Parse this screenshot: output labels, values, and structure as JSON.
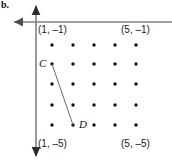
{
  "figure": {
    "part_label": "b."
  },
  "axes": {
    "x_axis": {
      "name": "x-axis",
      "orientation": "horizontal",
      "y": 22,
      "x_start": 14,
      "x_end": 172,
      "arrow": "left",
      "color": "#808080"
    },
    "y_axis": {
      "name": "y-axis",
      "orientation": "vertical",
      "x": 36,
      "y_start": 6,
      "y_end": 156,
      "arrow": "both",
      "color": "#808080"
    }
  },
  "corner_labels": {
    "top_left": "(1, –1)",
    "top_right": "(5, –1)",
    "bottom_left": "(1, –5)",
    "bottom_right": "(5, –5)"
  },
  "lattice": {
    "columns": 5,
    "rows": 5,
    "x_positions": [
      52,
      73,
      94,
      115,
      136
    ],
    "y_positions": [
      45,
      64,
      84,
      105,
      125
    ],
    "dot_radius": 1.7,
    "dot_color": "#111111",
    "x_values": [
      1,
      2,
      3,
      4,
      5
    ],
    "y_values": [
      -1,
      -2,
      -3,
      -4,
      -5
    ]
  },
  "points": [
    {
      "label": "C",
      "grid": [
        1,
        -2
      ],
      "x": 52,
      "y": 64,
      "label_side": "left"
    },
    {
      "label": "D",
      "grid": [
        2,
        -5
      ],
      "x": 73,
      "y": 125,
      "label_side": "right"
    }
  ],
  "segment": {
    "name": "segment-cd",
    "from": "C",
    "to": "D",
    "x1": 52,
    "y1": 64,
    "x2": 73,
    "y2": 125,
    "color": "#6b6b6b",
    "width": 1
  },
  "colors": {
    "axis": "#808080",
    "segment": "#6b6b6b",
    "dot": "#111111",
    "text": "#1a1a1a",
    "background": "#ffffff"
  }
}
